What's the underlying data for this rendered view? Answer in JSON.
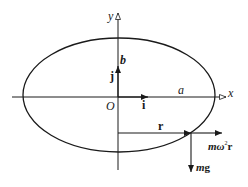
{
  "diagram": {
    "axes": {
      "x_label": "x",
      "y_label": "y",
      "origin_label": "O"
    },
    "ellipse": {
      "semi_major_label": "a",
      "semi_minor_label": "b"
    },
    "unit_vectors": {
      "i_label": "i",
      "j_label": "j"
    },
    "position_vector": {
      "label": "r"
    },
    "forces": {
      "centrifugal_label_m": "m",
      "centrifugal_label_omega": "ω",
      "centrifugal_label_sup": "2",
      "centrifugal_label_r": "r",
      "gravity_label_m": "m",
      "gravity_label_g": "g"
    },
    "colors": {
      "stroke": "#1a1a1a",
      "background": "#ffffff"
    }
  }
}
